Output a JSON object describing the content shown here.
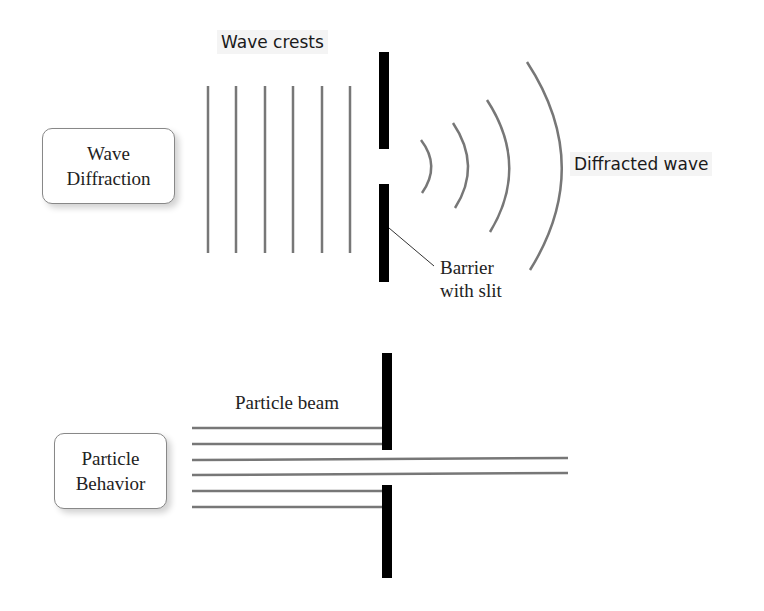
{
  "diagram": {
    "wave_section": {
      "box_label_line1": "Wave",
      "box_label_line2": "Diffraction",
      "crests_label": "Wave crests",
      "diffracted_label": "Diffracted wave",
      "barrier_label_line1": "Barrier",
      "barrier_label_line2": "with slit"
    },
    "particle_section": {
      "box_label_line1": "Particle",
      "box_label_line2": "Behavior",
      "beam_label": "Particle beam"
    }
  }
}
